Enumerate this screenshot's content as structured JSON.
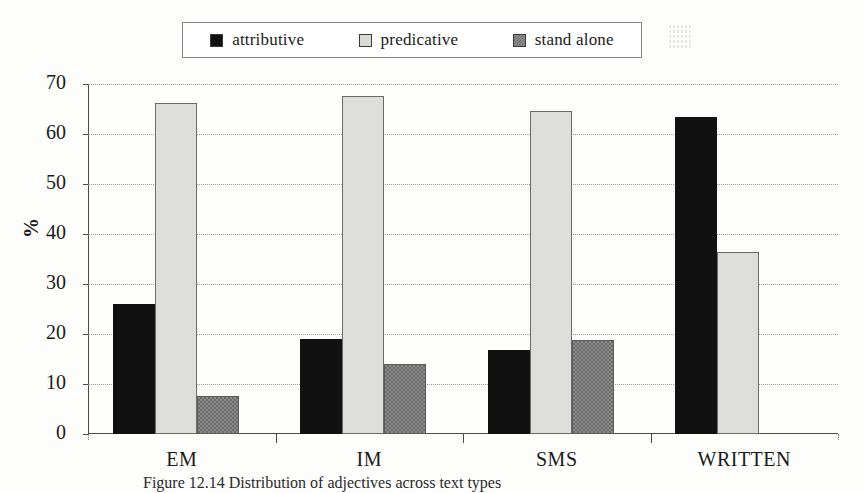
{
  "chart_data": {
    "type": "bar",
    "title": "",
    "xlabel": "",
    "ylabel": "%",
    "ylim": [
      0,
      70
    ],
    "yticks": [
      0,
      10,
      20,
      30,
      40,
      50,
      60,
      70
    ],
    "grid": true,
    "legend_position": "top-center",
    "categories": [
      "EM",
      "IM",
      "SMS",
      "WRITTEN"
    ],
    "series": [
      {
        "name": "attributive",
        "color": "#111111",
        "pattern": "solid-black",
        "values": [
          26.1,
          19.0,
          16.9,
          63.5
        ]
      },
      {
        "name": "predicative",
        "color": "#f2f2f0",
        "pattern": "light-dotted",
        "values": [
          66.3,
          67.6,
          64.6,
          36.5
        ]
      },
      {
        "name": "stand alone",
        "color": "#8c8c8c",
        "pattern": "gray-checker",
        "values": [
          7.7,
          14.0,
          18.9,
          null
        ]
      }
    ]
  },
  "legend": {
    "items": [
      {
        "label": "attributive",
        "swatch": "legend-swatch-attributive"
      },
      {
        "label": "predicative",
        "swatch": "legend-swatch-predicative"
      },
      {
        "label": "stand alone",
        "swatch": "legend-swatch-stand-alone"
      }
    ]
  },
  "axes": {
    "y_label": "%",
    "y_ticks": [
      "70",
      "60",
      "50",
      "40",
      "30",
      "20",
      "10",
      "0"
    ],
    "x_ticks": [
      "EM",
      "IM",
      "SMS",
      "WRITTEN"
    ]
  },
  "caption": {
    "text": "Figure 12.14 Distribution of adjectives across text types"
  }
}
